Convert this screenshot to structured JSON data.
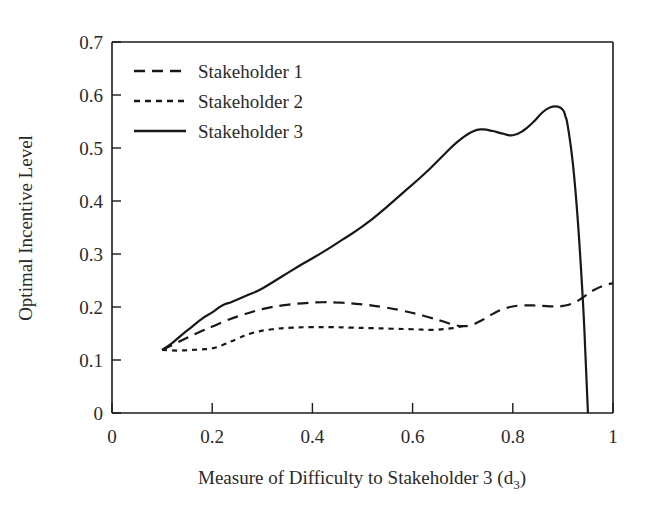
{
  "chart_data": {
    "type": "line",
    "title": "",
    "xlabel": "Measure of Difficulty to Stakeholder 3 (d3)",
    "xlabel_main": "Measure of Difficulty to Stakeholder 3 (d",
    "xlabel_sub": "3",
    "xlabel_close": ")",
    "ylabel": "Optimal Incentive Level",
    "xlim": [
      0,
      1
    ],
    "ylim": [
      0,
      0.7
    ],
    "xticks": [
      0,
      0.2,
      0.4,
      0.6,
      0.8,
      1
    ],
    "xtick_labels": [
      "0",
      "0.2",
      "0.4",
      "0.6",
      "0.8",
      "1"
    ],
    "yticks": [
      0,
      0.1,
      0.2,
      0.3,
      0.4,
      0.5,
      0.6,
      0.7
    ],
    "ytick_labels": [
      "0",
      "0.1",
      "0.2",
      "0.3",
      "0.4",
      "0.5",
      "0.6",
      "0.7"
    ],
    "grid": false,
    "legend_position": "upper-left-inside",
    "series": [
      {
        "name": "Stakeholder 1",
        "style": "dashed",
        "color": "#181818",
        "x": [
          0.1,
          0.12,
          0.15,
          0.18,
          0.2,
          0.23,
          0.26,
          0.3,
          0.34,
          0.38,
          0.42,
          0.46,
          0.5,
          0.54,
          0.58,
          0.62,
          0.66,
          0.68,
          0.7,
          0.72,
          0.74,
          0.76,
          0.78,
          0.8,
          0.82,
          0.84,
          0.86,
          0.88,
          0.9,
          0.92,
          0.94,
          0.96,
          0.98,
          1.0
        ],
        "y": [
          0.119,
          0.128,
          0.142,
          0.155,
          0.163,
          0.175,
          0.185,
          0.196,
          0.203,
          0.207,
          0.209,
          0.208,
          0.205,
          0.2,
          0.193,
          0.184,
          0.173,
          0.167,
          0.164,
          0.167,
          0.176,
          0.187,
          0.196,
          0.201,
          0.203,
          0.203,
          0.202,
          0.201,
          0.202,
          0.207,
          0.218,
          0.231,
          0.24,
          0.245
        ]
      },
      {
        "name": "Stakeholder 2",
        "style": "dotted",
        "color": "#181818",
        "x": [
          0.1,
          0.12,
          0.14,
          0.16,
          0.18,
          0.2,
          0.22,
          0.25,
          0.28,
          0.32,
          0.36,
          0.4,
          0.44,
          0.48,
          0.52,
          0.56,
          0.6,
          0.64,
          0.68,
          0.7
        ],
        "y": [
          0.119,
          0.118,
          0.118,
          0.119,
          0.12,
          0.122,
          0.128,
          0.14,
          0.151,
          0.158,
          0.161,
          0.162,
          0.162,
          0.161,
          0.16,
          0.159,
          0.158,
          0.157,
          0.16,
          0.164
        ]
      },
      {
        "name": "Stakeholder 3",
        "style": "solid",
        "color": "#181818",
        "x": [
          0.1,
          0.12,
          0.14,
          0.16,
          0.18,
          0.2,
          0.22,
          0.24,
          0.27,
          0.3,
          0.34,
          0.38,
          0.42,
          0.46,
          0.5,
          0.54,
          0.58,
          0.62,
          0.66,
          0.69,
          0.72,
          0.74,
          0.76,
          0.78,
          0.8,
          0.82,
          0.84,
          0.86,
          0.875,
          0.89,
          0.9,
          0.905,
          0.91,
          0.92,
          0.93,
          0.94,
          0.945,
          0.95
        ],
        "y": [
          0.119,
          0.132,
          0.148,
          0.163,
          0.178,
          0.19,
          0.203,
          0.21,
          0.222,
          0.235,
          0.258,
          0.281,
          0.303,
          0.327,
          0.352,
          0.382,
          0.415,
          0.448,
          0.485,
          0.512,
          0.531,
          0.535,
          0.532,
          0.527,
          0.524,
          0.532,
          0.548,
          0.568,
          0.577,
          0.578,
          0.572,
          0.56,
          0.54,
          0.47,
          0.36,
          0.21,
          0.11,
          0.0
        ]
      }
    ]
  },
  "legend": {
    "entries": [
      {
        "label": "Stakeholder 1",
        "style": "dashed"
      },
      {
        "label": "Stakeholder 2",
        "style": "dotted"
      },
      {
        "label": "Stakeholder 3",
        "style": "solid"
      }
    ]
  }
}
